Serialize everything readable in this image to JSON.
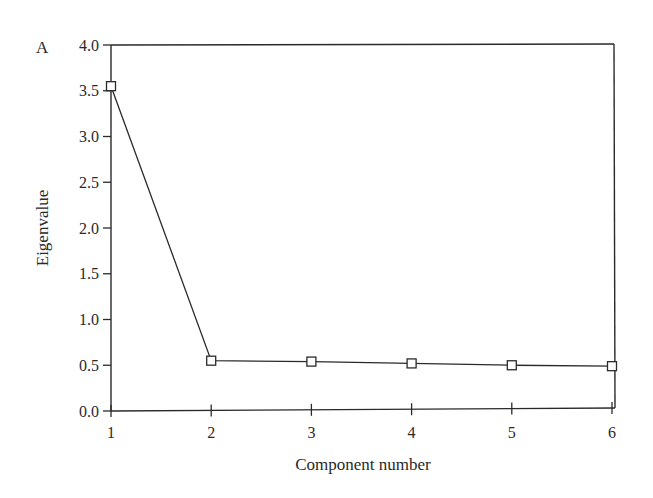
{
  "chart_data": {
    "type": "line",
    "panel_label": "A",
    "title": "",
    "xlabel": "Component number",
    "ylabel": "Eigenvalue",
    "x": [
      1,
      2,
      3,
      4,
      5,
      6
    ],
    "series": [
      {
        "name": "Eigenvalue",
        "marker": "square-open",
        "values": [
          3.55,
          0.55,
          0.54,
          0.52,
          0.5,
          0.49
        ]
      }
    ],
    "xlim": [
      1,
      6
    ],
    "ylim": [
      0,
      4
    ],
    "xticks": [
      "1",
      "2",
      "3",
      "4",
      "5",
      "6"
    ],
    "yticks": [
      "0.0",
      "0.5",
      "1.0",
      "1.5",
      "2.0",
      "2.5",
      "3.0",
      "3.5",
      "4.0"
    ],
    "grid": false,
    "legend": null,
    "colors": {
      "line": "#2a2a2a",
      "background": "#ffffff"
    }
  }
}
